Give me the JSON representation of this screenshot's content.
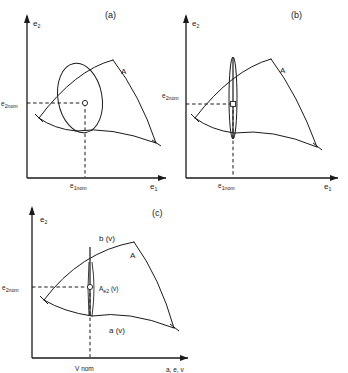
{
  "figure": {
    "background_color": "#ffffff",
    "line_color": "#1a1a1a"
  },
  "panels": [
    {
      "id": "a",
      "caption": "(a)",
      "y_axis_label": "e",
      "y_axis_sub": "2",
      "x_axis_label": "e",
      "x_axis_sub": "1",
      "y_tick_label": "e",
      "y_tick_sub": "2nom",
      "x_tick_label": "e",
      "x_tick_sub": "1nom",
      "region_label": "A",
      "marker": "nominal-operating-point",
      "ellipse": "wide-tilted"
    },
    {
      "id": "b",
      "caption": "(b)",
      "y_axis_label": "e",
      "y_axis_sub": "2",
      "x_axis_label": "e",
      "x_axis_sub": "1",
      "y_tick_label": "e",
      "y_tick_sub": "2nom",
      "x_tick_label": "e",
      "x_tick_sub": "1nom",
      "region_label": "A",
      "marker": "nominal-operating-point",
      "ellipse": "narrow-vertical"
    },
    {
      "id": "c",
      "caption": "(c)",
      "y_axis_label": "e",
      "y_axis_sub": "2",
      "x_axis_label": "a, e, v",
      "y_tick_label": "e",
      "y_tick_sub": "2nom",
      "x_tick_label": "V nom",
      "region_label": "A",
      "upper_bound_label": "b (v)",
      "lower_bound_label": "a (v)",
      "segment_label": "A",
      "segment_sub": "e2",
      "segment_suffix": " (v)",
      "marker": "nominal-operating-point",
      "ellipse": "degenerate-segment"
    }
  ]
}
